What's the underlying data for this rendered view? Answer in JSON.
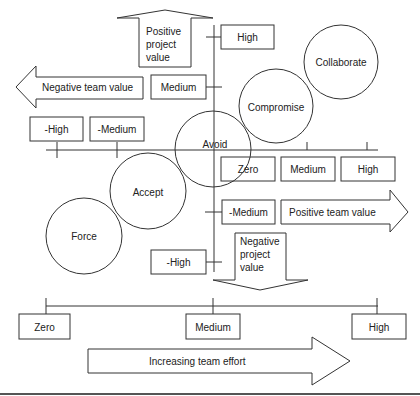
{
  "colors": {
    "line": "#333333",
    "text": "#222222",
    "background": "#ffffff"
  },
  "arrows": {
    "positive_project": {
      "line1": "Positive",
      "line2": "project",
      "line3": "value"
    },
    "negative_project": {
      "line1": "Negative",
      "line2": "project",
      "line3": "value"
    },
    "negative_team": {
      "label": "Negative team value"
    },
    "positive_team": {
      "label": "Positive team value"
    },
    "team_effort": {
      "label": "Increasing team effort"
    }
  },
  "project_axis_labels": {
    "high": "High",
    "medium": "Medium",
    "neg_medium": "-Medium",
    "neg_high": "-High"
  },
  "team_axis_labels": {
    "neg_high": "-High",
    "neg_medium": "-Medium",
    "zero": "Zero",
    "medium": "Medium",
    "high": "High"
  },
  "effort_axis_labels": {
    "zero": "Zero",
    "medium": "Medium",
    "high": "High"
  },
  "strategies": {
    "collaborate": "Collaborate",
    "compromise": "Compromise",
    "avoid": "Avoid",
    "accept": "Accept",
    "force": "Force"
  }
}
